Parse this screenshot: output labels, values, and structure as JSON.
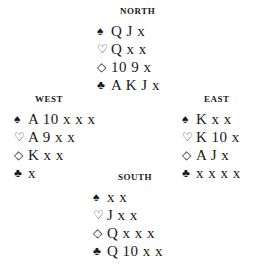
{
  "hands": {
    "north": {
      "label": "NORTH",
      "suits": [
        {
          "icon": "♠",
          "icon_name": "spade-icon",
          "cards": "Q J x"
        },
        {
          "icon": "♡",
          "icon_name": "heart-icon",
          "cards": "Q x x"
        },
        {
          "icon": "◇",
          "icon_name": "diamond-icon",
          "cards": "10 9 x"
        },
        {
          "icon": "♣",
          "icon_name": "club-icon",
          "cards": "A K J x"
        }
      ]
    },
    "west": {
      "label": "WEST",
      "suits": [
        {
          "icon": "♠",
          "icon_name": "spade-icon",
          "cards": "A 10 x x x"
        },
        {
          "icon": "♡",
          "icon_name": "heart-icon",
          "cards": "A 9 x x"
        },
        {
          "icon": "◇",
          "icon_name": "diamond-icon",
          "cards": "K x x"
        },
        {
          "icon": "♣",
          "icon_name": "club-icon",
          "cards": "x"
        }
      ]
    },
    "east": {
      "label": "EAST",
      "suits": [
        {
          "icon": "♠",
          "icon_name": "spade-icon",
          "cards": "K x x"
        },
        {
          "icon": "♡",
          "icon_name": "heart-icon",
          "cards": "K 10 x"
        },
        {
          "icon": "◇",
          "icon_name": "diamond-icon",
          "cards": "A J x"
        },
        {
          "icon": "♣",
          "icon_name": "club-icon",
          "cards": "x x x x"
        }
      ]
    },
    "south": {
      "label": "SOUTH",
      "suits": [
        {
          "icon": "♠",
          "icon_name": "spade-icon",
          "cards": "x x"
        },
        {
          "icon": "♡",
          "icon_name": "heart-icon",
          "cards": "J x x"
        },
        {
          "icon": "◇",
          "icon_name": "diamond-icon",
          "cards": "Q x x x"
        },
        {
          "icon": "♣",
          "icon_name": "club-icon",
          "cards": "Q 10 x x"
        }
      ]
    }
  }
}
